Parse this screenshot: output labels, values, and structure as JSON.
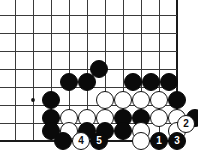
{
  "diagram": {
    "type": "go-board-diagram",
    "board": {
      "cols": 10,
      "rows": 8,
      "origin_x": 15,
      "origin_y": 15,
      "spacing": 18,
      "edge_bottom": true,
      "edge_right": true,
      "line_color": "#3a3a3a",
      "edge_color": "#1a1a1a",
      "background": "#ffffff"
    },
    "star_points": [
      {
        "x": 33,
        "y": 100
      }
    ],
    "stones": [
      {
        "color": "black",
        "x": 99,
        "y": 69,
        "label": ""
      },
      {
        "color": "black",
        "x": 69,
        "y": 82,
        "label": ""
      },
      {
        "color": "black",
        "x": 87,
        "y": 82,
        "label": ""
      },
      {
        "color": "black",
        "x": 133,
        "y": 82,
        "label": ""
      },
      {
        "color": "black",
        "x": 151,
        "y": 82,
        "label": ""
      },
      {
        "color": "black",
        "x": 169,
        "y": 82,
        "label": ""
      },
      {
        "color": "black",
        "x": 51,
        "y": 100,
        "label": ""
      },
      {
        "color": "white",
        "x": 105,
        "y": 100,
        "label": ""
      },
      {
        "color": "white",
        "x": 123,
        "y": 100,
        "label": ""
      },
      {
        "color": "white",
        "x": 141,
        "y": 100,
        "label": ""
      },
      {
        "color": "white",
        "x": 159,
        "y": 100,
        "label": ""
      },
      {
        "color": "black",
        "x": 177,
        "y": 100,
        "label": ""
      },
      {
        "color": "black",
        "x": 51,
        "y": 118,
        "label": ""
      },
      {
        "color": "white",
        "x": 69,
        "y": 118,
        "label": ""
      },
      {
        "color": "white",
        "x": 87,
        "y": 118,
        "label": ""
      },
      {
        "color": "white",
        "x": 105,
        "y": 118,
        "label": ""
      },
      {
        "color": "black",
        "x": 123,
        "y": 118,
        "label": ""
      },
      {
        "color": "black",
        "x": 141,
        "y": 118,
        "label": ""
      },
      {
        "color": "white",
        "x": 159,
        "y": 118,
        "label": ""
      },
      {
        "color": "white",
        "x": 177,
        "y": 118,
        "label": ""
      },
      {
        "color": "black",
        "x": 195,
        "y": 118,
        "label": ""
      },
      {
        "color": "black",
        "x": 51,
        "y": 131,
        "label": ""
      },
      {
        "color": "white",
        "x": 69,
        "y": 131,
        "label": ""
      },
      {
        "color": "black",
        "x": 87,
        "y": 131,
        "label": ""
      },
      {
        "color": "black",
        "x": 105,
        "y": 131,
        "label": ""
      },
      {
        "color": "black",
        "x": 123,
        "y": 131,
        "label": ""
      },
      {
        "color": "white",
        "x": 141,
        "y": 131,
        "label": ""
      },
      {
        "color": "white",
        "x": 177,
        "y": 131,
        "label": ""
      },
      {
        "color": "white",
        "x": 186,
        "y": 124,
        "label": "2"
      },
      {
        "color": "black",
        "x": 63,
        "y": 141,
        "label": ""
      },
      {
        "color": "white",
        "x": 81,
        "y": 141,
        "label": "4"
      },
      {
        "color": "black",
        "x": 99,
        "y": 141,
        "label": "5"
      },
      {
        "color": "white",
        "x": 141,
        "y": 141,
        "label": ""
      },
      {
        "color": "black",
        "x": 159,
        "y": 141,
        "label": "1"
      },
      {
        "color": "black",
        "x": 177,
        "y": 141,
        "label": "3"
      }
    ],
    "move_sequence": [
      {
        "number": "1",
        "color": "black"
      },
      {
        "number": "2",
        "color": "white"
      },
      {
        "number": "3",
        "color": "black"
      },
      {
        "number": "4",
        "color": "white"
      },
      {
        "number": "5",
        "color": "black"
      }
    ],
    "stone_radius": 9.2
  }
}
